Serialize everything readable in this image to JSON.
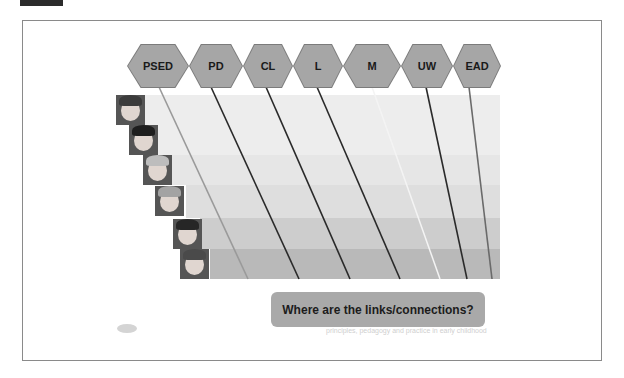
{
  "slide": {
    "areas": [
      {
        "label": "PSED",
        "x": 127,
        "w": 62,
        "line_top_x": 159,
        "line_bottom_x": 248,
        "line_color": "#9a9a9a"
      },
      {
        "label": "PD",
        "x": 189,
        "w": 54,
        "line_top_x": 211,
        "line_bottom_x": 299,
        "line_color": "#2a2a2a"
      },
      {
        "label": "CL",
        "x": 243,
        "w": 50,
        "line_top_x": 266,
        "line_bottom_x": 350,
        "line_color": "#2a2a2a"
      },
      {
        "label": "L",
        "x": 293,
        "w": 50,
        "line_top_x": 317,
        "line_bottom_x": 400,
        "line_color": "#2a2a2a"
      },
      {
        "label": "M",
        "x": 343,
        "w": 58,
        "line_top_x": 372,
        "line_bottom_x": 440,
        "line_color": "#f4f4f4"
      },
      {
        "label": "UW",
        "x": 401,
        "w": 52,
        "line_top_x": 426,
        "line_bottom_x": 467,
        "line_color": "#2a2a2a"
      },
      {
        "label": "EAD",
        "x": 453,
        "w": 48,
        "line_top_x": 469,
        "line_bottom_x": 492,
        "line_color": "#6a6a6a"
      }
    ],
    "bands": [
      {
        "top": 95,
        "height": 60,
        "left": 145,
        "color": "#ededed"
      },
      {
        "top": 155,
        "height": 30,
        "left": 172,
        "color": "#e6e6e6"
      },
      {
        "top": 185,
        "height": 33,
        "left": 186,
        "color": "#dedede"
      },
      {
        "top": 218,
        "height": 31,
        "left": 200,
        "color": "#cdcdcd"
      },
      {
        "top": 249,
        "height": 30,
        "left": 210,
        "color": "#b9b9b9"
      }
    ],
    "photos": [
      {
        "alt": "child-photo-1",
        "x": 116,
        "y": 95,
        "hair": "#3b3b3b"
      },
      {
        "alt": "child-photo-2",
        "x": 129,
        "y": 125,
        "hair": "#1e1e1e"
      },
      {
        "alt": "child-photo-3",
        "x": 143,
        "y": 155,
        "hair": "#bdbdbd"
      },
      {
        "alt": "child-photo-4",
        "x": 155,
        "y": 186,
        "hair": "#a3a3a3"
      },
      {
        "alt": "child-photo-5",
        "x": 173,
        "y": 219,
        "hair": "#262626"
      },
      {
        "alt": "child-photo-6",
        "x": 180,
        "y": 249,
        "hair": "#4a4a4a"
      }
    ],
    "callout": "Where are the links/connections?",
    "footer": "principles, pedagogy and practice in early childhood"
  }
}
